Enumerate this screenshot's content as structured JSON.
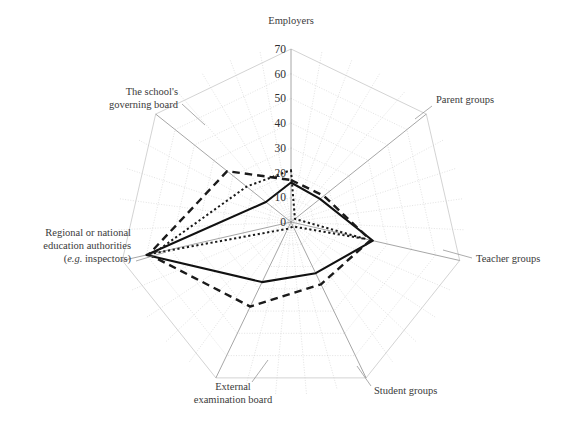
{
  "chart_data": {
    "type": "radar",
    "title": "",
    "categories": [
      "Employers",
      "Parent groups",
      "Teacher groups",
      "Student groups",
      "External examination board",
      "Regional or national education authorities (e.g. inspectors)",
      "The school's governing board"
    ],
    "category_labels": [
      {
        "lines": [
          "Employers"
        ],
        "italic_part": ""
      },
      {
        "lines": [
          "Parent groups"
        ],
        "italic_part": ""
      },
      {
        "lines": [
          "Teacher groups"
        ],
        "italic_part": ""
      },
      {
        "lines": [
          "Student groups"
        ],
        "italic_part": ""
      },
      {
        "lines": [
          "External",
          "examination board"
        ],
        "italic_part": ""
      },
      {
        "lines": [
          "Regional or national",
          "education authorities",
          "(e.g. inspectors)"
        ],
        "italic_part": "e.g."
      },
      {
        "lines": [
          "The school's",
          "governing board"
        ],
        "italic_part": ""
      }
    ],
    "ylabel": "",
    "xlabel": "",
    "rlim": [
      0,
      70
    ],
    "tick_labels": [
      "0",
      "10",
      "20",
      "30",
      "40",
      "50",
      "60",
      "70"
    ],
    "tick_values": [
      0,
      10,
      20,
      30,
      40,
      50,
      60,
      70
    ],
    "grid": true,
    "legend": "none",
    "series": [
      {
        "name": "series-solid",
        "style": "solid",
        "values": [
          16,
          15,
          34,
          23,
          27,
          60,
          13
        ]
      },
      {
        "name": "series-dashed",
        "style": "dashed",
        "values": [
          17,
          17,
          33,
          28,
          38,
          59,
          33
        ]
      },
      {
        "name": "series-dotted",
        "style": "dotted",
        "values": [
          21,
          2,
          31,
          2,
          3,
          57,
          23
        ]
      }
    ]
  },
  "colors": {
    "background": "#ffffff",
    "grid": "#c9c9c9",
    "spoke": "#9a9a9a",
    "text": "#333333",
    "series": "#111111"
  }
}
